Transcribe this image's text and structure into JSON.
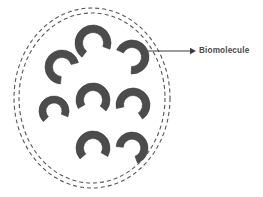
{
  "figure": {
    "type": "diagram",
    "width": 263,
    "height": 197,
    "background_color": "#ffffff"
  },
  "annotations": [
    {
      "id": "biomolecule-callout",
      "label": "Biomolecule",
      "text_color": "#4a4a4a",
      "pointer": {
        "kind": "arrow",
        "from_x": 148,
        "from_y": 51,
        "to_x": 196,
        "to_y": 51,
        "color": "#3b3b3b"
      },
      "label_x": 199,
      "label_y": 51
    }
  ],
  "membrane": {
    "name": "vesicle-membrane",
    "style": "double-dashed-ellipse",
    "stroke_color": "#555555",
    "dash_pattern": "4 3",
    "center_x": 92,
    "center_y": 98,
    "outer_rx": 78,
    "outer_ry": 90,
    "inner_rx": 73,
    "inner_ry": 85
  },
  "biomolecules": {
    "count": 8,
    "fill_color": "#4c4c4c",
    "stroke_color": "#3d3d3d",
    "shape": "crescent-arc",
    "items": [
      {
        "id": "biomolecule-1",
        "cx": 93,
        "cy": 43,
        "r": 18,
        "thickness": 7.5,
        "rotation": 128,
        "sweep": 252
      },
      {
        "id": "biomolecule-2",
        "cx": 132,
        "cy": 57,
        "r": 17,
        "thickness": 7.5,
        "rotation": 205,
        "sweep": 248
      },
      {
        "id": "biomolecule-3",
        "cx": 62,
        "cy": 67,
        "r": 17,
        "thickness": 7.5,
        "rotation": 95,
        "sweep": 250
      },
      {
        "id": "biomolecule-4",
        "cx": 93,
        "cy": 100,
        "r": 17,
        "thickness": 7.5,
        "rotation": 150,
        "sweep": 250
      },
      {
        "id": "biomolecule-5",
        "cx": 54,
        "cy": 111,
        "r": 15,
        "thickness": 7.0,
        "rotation": 135,
        "sweep": 248
      },
      {
        "id": "biomolecule-6",
        "cx": 133,
        "cy": 105,
        "r": 17,
        "thickness": 7.5,
        "rotation": 168,
        "sweep": 248
      },
      {
        "id": "biomolecule-7",
        "cx": 93,
        "cy": 148,
        "r": 17,
        "thickness": 7.5,
        "rotation": 140,
        "sweep": 250
      },
      {
        "id": "biomolecule-8",
        "cx": 132,
        "cy": 148,
        "r": 16,
        "thickness": 7.2,
        "rotation": 185,
        "sweep": 245
      }
    ]
  }
}
